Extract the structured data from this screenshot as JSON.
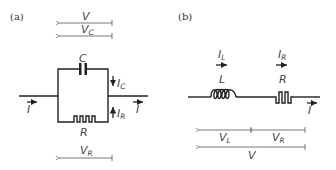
{
  "panels": [
    {
      "id": "a",
      "label": "(a)",
      "topology": "parallel RC",
      "components": [
        {
          "symbol": "C",
          "type": "capacitor"
        },
        {
          "symbol": "R",
          "type": "resistor"
        }
      ],
      "currents": [
        {
          "symbol": "I",
          "sub": "",
          "where": "input"
        },
        {
          "symbol": "I",
          "sub": "",
          "where": "output"
        },
        {
          "symbol": "I",
          "sub": "C",
          "where": "capacitor branch"
        },
        {
          "symbol": "I",
          "sub": "R",
          "where": "resistor branch"
        }
      ],
      "voltages": [
        {
          "symbol": "V",
          "sub": ""
        },
        {
          "symbol": "V",
          "sub": "C"
        },
        {
          "symbol": "V",
          "sub": "R"
        }
      ]
    },
    {
      "id": "b",
      "label": "(b)",
      "topology": "series LR",
      "components": [
        {
          "symbol": "L",
          "type": "inductor"
        },
        {
          "symbol": "R",
          "type": "resistor"
        }
      ],
      "currents": [
        {
          "symbol": "I",
          "sub": "L"
        },
        {
          "symbol": "I",
          "sub": "R"
        },
        {
          "symbol": "I",
          "sub": ""
        }
      ],
      "voltages": [
        {
          "symbol": "V",
          "sub": "L"
        },
        {
          "symbol": "V",
          "sub": "R"
        },
        {
          "symbol": "V",
          "sub": ""
        }
      ]
    }
  ]
}
